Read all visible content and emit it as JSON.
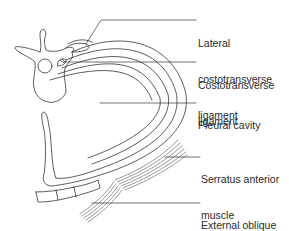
{
  "figure": {
    "type": "anatomical-cross-section"
  },
  "labels": [
    {
      "id": "lateral-costotransverse-ligament",
      "line1": "Lateral",
      "line2": "costotransverse",
      "line3": "ligament"
    },
    {
      "id": "costotransverse-ligament",
      "line1": "Costotransverse",
      "line2": "ligament"
    },
    {
      "id": "pleural-cavity",
      "line1": "Pleural cavity"
    },
    {
      "id": "serratus-anterior-muscle",
      "line1": "Serratus anterior",
      "line2": "muscle"
    },
    {
      "id": "external-oblique-muscle",
      "line1": "External oblique",
      "line2": "muscle"
    }
  ],
  "colors": {
    "line": "#333333",
    "background": "#ffffff"
  }
}
